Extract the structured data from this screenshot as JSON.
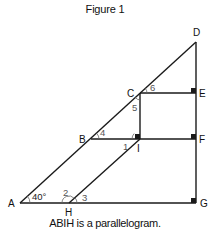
{
  "figure": {
    "title": "Figure 1",
    "caption": "ABIH is a parallelogram."
  },
  "points": {
    "A": "A",
    "B": "B",
    "C": "C",
    "D": "D",
    "E": "E",
    "F": "F",
    "G": "G",
    "H": "H",
    "I": "I"
  },
  "angles": {
    "a40": "40°",
    "a1": "1",
    "a2": "2",
    "a3": "3",
    "a4": "4",
    "a5": "5",
    "a6": "6"
  },
  "colors": {
    "line": "#1a1a1a",
    "label": "#111111",
    "angle_label": "#555555"
  }
}
